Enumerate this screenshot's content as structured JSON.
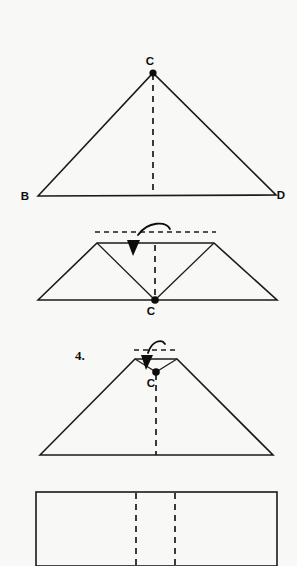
{
  "page": {
    "background_color": "#f8f8f7",
    "ink_color": "#1a1a1a",
    "width": 297,
    "height": 566,
    "kind": "origami-folding-instruction-diagram"
  },
  "steps": [
    {
      "id": "step-triangle",
      "number_label": "",
      "caption": "",
      "shape": "triangle",
      "vertices": {
        "B": {
          "x": 38,
          "y": 196,
          "label": "B",
          "label_x": 25,
          "label_y": 200,
          "dot": false
        },
        "C": {
          "x": 153,
          "y": 73,
          "label": "C",
          "label_x": 150,
          "label_y": 65,
          "dot": true
        },
        "D": {
          "x": 276,
          "y": 195,
          "label": "D",
          "label_x": 281,
          "label_y": 199,
          "dot": false
        }
      },
      "outline_points": "38,196 153,73 276,195 38,196",
      "crease": {
        "x1": 153,
        "y1": 74,
        "x2": 153,
        "y2": 196
      },
      "arrow": null
    },
    {
      "id": "step-trapezoid-valley",
      "number_label": "",
      "caption": "",
      "shape": "trapezoid-with-valley",
      "vertices": {
        "C": {
          "x": 155,
          "y": 300,
          "label": "C",
          "label_x": 151,
          "label_y": 315,
          "dot": true
        }
      },
      "outline_points": "38,300 97,243 214,243 277,300 38,300",
      "valley_points": "97,243 155,300 214,243",
      "crease": {
        "x1": 155,
        "y1": 245,
        "x2": 155,
        "y2": 299
      },
      "fold_line": {
        "x1": 95,
        "y1": 232,
        "x2": 216,
        "y2": 232
      },
      "arrow": {
        "path": "M 170,229 C 166,221 148,221 138,235",
        "head_points": "133,256 127,240 140,240"
      }
    },
    {
      "id": "step-4",
      "number_label": "4.",
      "number_x": 75,
      "number_y": 360,
      "caption": "",
      "shape": "trapezoid-with-notch",
      "vertices": {
        "C": {
          "x": 156,
          "y": 372,
          "label": "C",
          "label_x": 151,
          "label_y": 387,
          "dot": true
        }
      },
      "outline_points": "40,455 135,359 177,359 273,455 40,455",
      "valley_points": "135,359 156,372 177,359",
      "crease": {
        "x1": 156,
        "y1": 374,
        "x2": 156,
        "y2": 455
      },
      "fold_line": {
        "x1": 134,
        "y1": 350,
        "x2": 178,
        "y2": 350
      },
      "arrow": {
        "path": "M 165,344 C 162,339 152,340 148,353",
        "head_points": "146,370 141,355 153,355"
      }
    },
    {
      "id": "step-rectangle",
      "number_label": "",
      "caption": "",
      "shape": "rectangle-with-two-creases",
      "vertices": {},
      "rect": {
        "x": 36,
        "y": 492,
        "width": 241,
        "height": 74
      },
      "creases": [
        {
          "x1": 136,
          "y1": 493,
          "x2": 136,
          "y2": 566
        },
        {
          "x1": 175,
          "y1": 493,
          "x2": 175,
          "y2": 566
        }
      ],
      "arrow": null
    }
  ],
  "labels": {
    "B": "B",
    "C": "C",
    "D": "D",
    "step_four": "4."
  }
}
